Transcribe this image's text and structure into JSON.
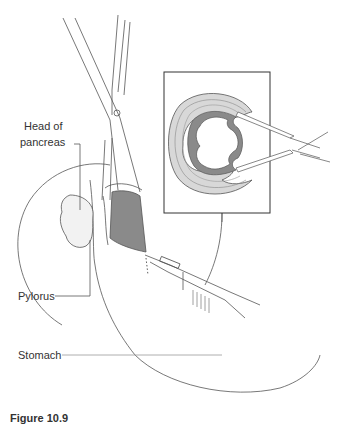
{
  "figure": {
    "caption": "Figure 10.9",
    "labels": {
      "head_of_pancreas_line1": "Head of",
      "head_of_pancreas_line2": "pancreas",
      "pylorus": "Pylorus",
      "stomach": "Stomach"
    },
    "colors": {
      "line": "#555555",
      "mucosa_fill": "#8a8a8a",
      "wall_fill": "#cfcfcf",
      "background": "#ffffff"
    },
    "inset": {
      "description": "cross-section of pyloric wall held by forceps"
    }
  }
}
